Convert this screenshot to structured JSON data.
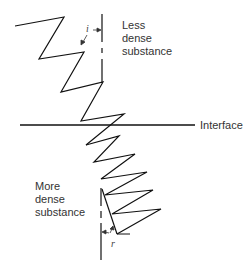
{
  "diagram": {
    "labels": {
      "less_dense": "Less\ndense\nsubstance",
      "more_dense": "More\ndense\nsubstance",
      "interface": "Interface",
      "angle_incidence": "i",
      "angle_refraction": "r"
    },
    "colors": {
      "line": "#111111",
      "text": "#333333",
      "background": "#ffffff"
    },
    "zigzag_upper_points": "15,26 64,17 39,59 84,52 61,92 103,82 81,121 124,114 86,145",
    "zigzag_lower_points": "86,145 119,136 94,162 135,154 101,179 147,172 105,195 153,190 112,214 161,209 117,234",
    "refracted_ray": "102,188 117,233"
  }
}
